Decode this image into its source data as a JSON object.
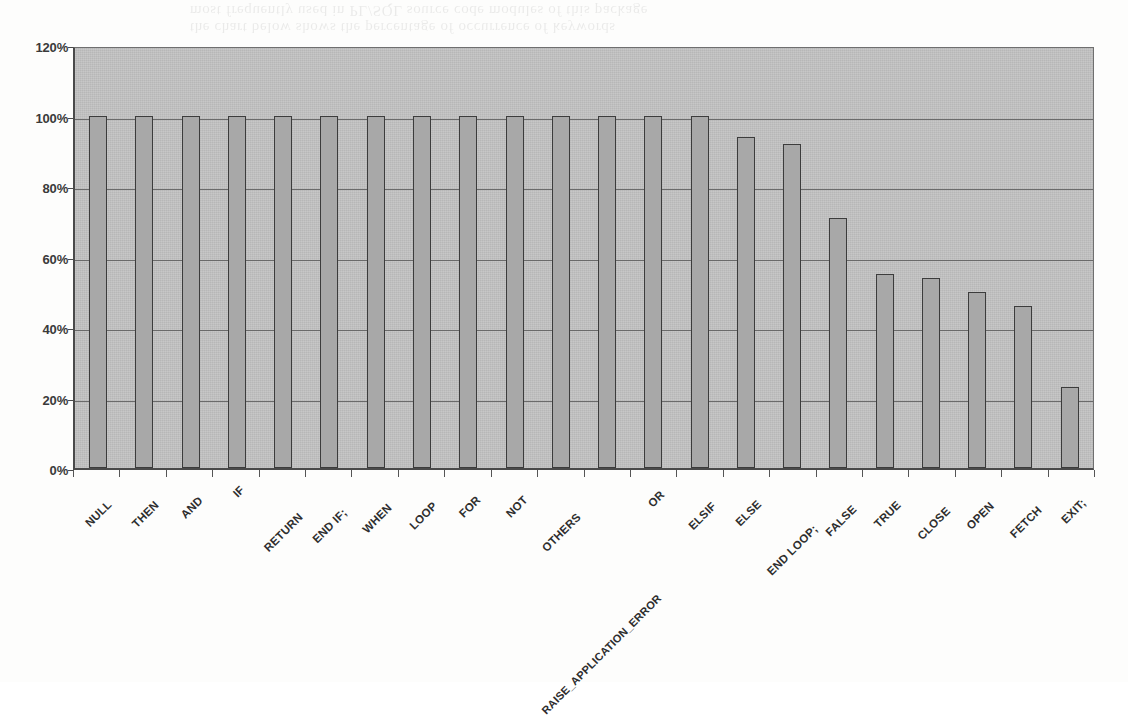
{
  "page": {
    "ghost_text_line1": "the chart below shows the percentage of occurrence of keywords",
    "ghost_text_line2": "most frequently used in PL/SQL source code modules of this package"
  },
  "chart_data": {
    "type": "bar",
    "title": "",
    "xlabel": "",
    "ylabel": "",
    "ylim": [
      0,
      120
    ],
    "ytick_labels": [
      "0%",
      "20%",
      "40%",
      "60%",
      "80%",
      "100%",
      "120%"
    ],
    "ytick_values": [
      0,
      20,
      40,
      60,
      80,
      100,
      120
    ],
    "grid": true,
    "legend": "none",
    "value_suffix": "%",
    "categories": [
      "NULL",
      "THEN",
      "AND",
      "IF",
      "RETURN",
      "END IF;",
      "WHEN",
      "LOOP",
      "FOR",
      "NOT",
      "OTHERS",
      "RAISE_APPLICATION_ERROR",
      "OR",
      "ELSIF",
      "ELSE",
      "END LOOP;",
      "FALSE",
      "TRUE",
      "CLOSE",
      "OPEN",
      "FETCH",
      "EXIT;"
    ],
    "values": [
      100,
      100,
      100,
      100,
      100,
      100,
      100,
      100,
      100,
      100,
      100,
      100,
      100,
      100,
      94,
      92,
      71,
      55,
      54,
      50,
      46,
      23
    ]
  },
  "style": {
    "plot_background": "#c2c2c2",
    "bar_fill": "#a8a8a8",
    "bar_border": "#3c3c3c",
    "gridline_color": "#6a6a6a",
    "axis_color": "#4a4a4a",
    "text_color": "#2e2e2e"
  }
}
